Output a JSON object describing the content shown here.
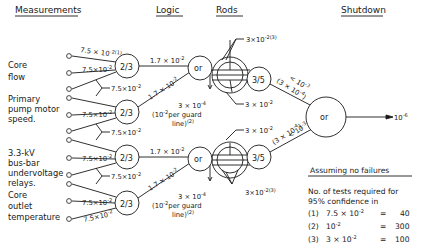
{
  "headers": {
    "measurements": "Measurements",
    "logic": "Logic",
    "rods": "Rods",
    "shutdown": "Shutdown"
  },
  "measurements": [
    {
      "line1": "Core",
      "line2": "flow",
      "line3": ""
    },
    {
      "line1": "Primary",
      "line2": "pump motor",
      "line3": "speed."
    },
    {
      "line1": "3.3-kV",
      "line2": "bus-bar",
      "line3": "undervoltage",
      "line4": "relays."
    },
    {
      "line1": "Core",
      "line2": "outlet",
      "line3": "temperature"
    }
  ],
  "channel_values": {
    "top_note": "7.5 × 10",
    "top_note_exp": "-2",
    "top_note_ref": "(1)",
    "channel": "7.5×10",
    "channel_exp": "-2",
    "between": "7.5×10",
    "between_exp": "-2"
  },
  "logic": {
    "gate_label": "2/3",
    "to_or": "1.7 × 10",
    "to_or_exp": "-2",
    "or_label": "or",
    "guard_value": "3 × 10",
    "guard_exp": "-4",
    "guard_note_a": "(10",
    "guard_note_a_exp": "-2",
    "guard_note_b": "per guard",
    "guard_note_c": "line)",
    "guard_note_ref": "(2)"
  },
  "rods": {
    "gate_label": "3/5",
    "rod_value": "3×10",
    "rod_exp": "-2",
    "rod_ref": "(3)",
    "mid_value": "3 × 10",
    "mid_exp": "-2",
    "out_a": "< 10",
    "out_a_exp": "-3",
    "out_b": "(3 × 10",
    "out_b_exp": "-4",
    "out_b_close": ")"
  },
  "shutdown": {
    "or_label": "or",
    "output": "10",
    "output_exp": "-6"
  },
  "assumptions": {
    "title": "Assuming no failures",
    "intro_1": "No. of tests required for",
    "intro_2": "95% confidence in",
    "rows": [
      {
        "ref": "(1)",
        "value": "7.5 × 10",
        "exp": "-2",
        "eq": "=",
        "tests": "40"
      },
      {
        "ref": "(2)",
        "value": "10",
        "exp": "-2",
        "eq": "=",
        "tests": "300"
      },
      {
        "ref": "(3)",
        "value": "3 × 10",
        "exp": "-2",
        "eq": "=",
        "tests": "100"
      }
    ]
  }
}
